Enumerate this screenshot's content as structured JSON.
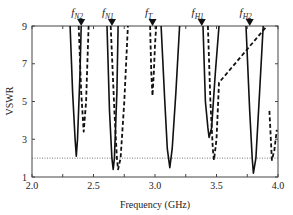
{
  "chart_data": {
    "type": "line",
    "title": "",
    "xlabel": "Frequency (GHz)",
    "ylabel": "VSWR",
    "xlim": [
      2.0,
      4.0
    ],
    "ylim": [
      1,
      9
    ],
    "x_ticks": [
      "2.0",
      "2.5",
      "3.0",
      "3.5",
      "4.0"
    ],
    "y_ticks": [
      "1",
      "3",
      "5",
      "7",
      "9"
    ],
    "grid": false,
    "reference_line": {
      "y": 2,
      "style": "dotted"
    },
    "markers": [
      {
        "label": "f",
        "sub": "N2",
        "x": 2.4
      },
      {
        "label": "f",
        "sub": "N1",
        "x": 2.65
      },
      {
        "label": "f",
        "sub": "T",
        "x": 2.98
      },
      {
        "label": "f",
        "sub": "H1",
        "x": 3.38
      },
      {
        "label": "f",
        "sub": "H2",
        "x": 3.77
      }
    ],
    "series": [
      {
        "name": "solid",
        "style": "solid",
        "x": [
          2.31,
          2.33,
          2.35,
          2.36,
          2.37,
          2.39,
          2.4,
          2.61,
          2.63,
          2.65,
          2.66,
          2.67,
          2.69,
          2.7,
          3.05,
          3.08,
          3.1,
          3.12,
          3.14,
          3.17,
          3.2,
          3.39,
          3.41,
          3.43,
          3.44,
          3.46,
          3.49,
          3.52,
          3.74,
          3.77,
          3.79,
          3.8,
          3.82,
          3.85,
          3.88
        ],
        "y": [
          9,
          5.5,
          3.0,
          2.1,
          3.0,
          6.5,
          9,
          9,
          4.5,
          2.0,
          1.4,
          2.0,
          5.5,
          9,
          9,
          5.0,
          2.5,
          1.5,
          2.5,
          5.5,
          9,
          9,
          5.0,
          3.6,
          3.1,
          3.6,
          6.5,
          9,
          9,
          4.5,
          2.0,
          1.2,
          2.0,
          5.5,
          9
        ]
      },
      {
        "name": "dashed",
        "style": "dashed",
        "x": [
          2.38,
          2.4,
          2.42,
          2.44,
          2.46,
          2.64,
          2.67,
          2.69,
          2.7,
          2.72,
          2.75,
          2.78,
          2.96,
          2.97,
          2.98,
          2.99,
          3.0,
          3.01,
          3.43,
          3.45,
          3.47,
          3.48,
          3.5,
          3.52,
          3.91,
          3.93,
          3.95,
          3.97,
          3.99
        ],
        "y": [
          9,
          5.5,
          3.4,
          5.0,
          9,
          9,
          4.5,
          2.0,
          1.4,
          2.0,
          5.0,
          9,
          9,
          6.5,
          5.3,
          6.5,
          8.0,
          9,
          9,
          5.0,
          2.5,
          1.9,
          3.0,
          6.0,
          9,
          4.5,
          1.9,
          2.4,
          3.5
        ]
      }
    ]
  }
}
